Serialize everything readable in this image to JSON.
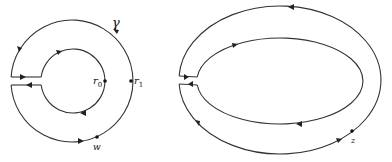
{
  "figure": {
    "left_panel": {
      "description": "Keyhole contour: annulus between circles of radius r0 and r1 with a slit on the left",
      "labels": {
        "gamma": "γ",
        "r0_main": "r",
        "r0_sub": "0",
        "r1_main": "r",
        "r1_sub": "1",
        "w": "w"
      }
    },
    "right_panel": {
      "description": "Keyhole contour between two nested ellipses with a slit on the left",
      "labels": {
        "z": "z"
      }
    },
    "colors": {
      "stroke": "#333333",
      "background": "#ffffff"
    }
  }
}
